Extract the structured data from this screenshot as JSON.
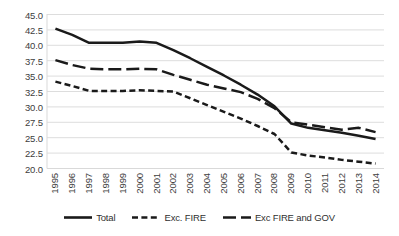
{
  "chart_data": {
    "type": "line",
    "title": "",
    "subtitle": "",
    "xlabel": "",
    "ylabel": "",
    "grid": "horizontal",
    "legend_position": "bottom",
    "ylim": [
      20.0,
      45.0
    ],
    "ytick_step": 2.5,
    "ytick_labels": [
      "45.0",
      "42.5",
      "40.0",
      "37.5",
      "35.0",
      "32.5",
      "30.0",
      "27.5",
      "25.0",
      "22.5",
      "20.0"
    ],
    "categories": [
      "1995",
      "1996",
      "1997",
      "1998",
      "1999",
      "2000",
      "2001",
      "2002",
      "2003",
      "2004",
      "2005",
      "2006",
      "2007",
      "2008",
      "2009",
      "2010",
      "2011",
      "2012",
      "2013",
      "2014"
    ],
    "series": [
      {
        "name": "Total",
        "style": "solid",
        "color": "#1a1a1a",
        "values": [
          42.7,
          41.7,
          40.4,
          40.4,
          40.4,
          40.6,
          40.4,
          39.2,
          37.9,
          36.5,
          35.1,
          33.6,
          32.0,
          30.1,
          27.3,
          26.6,
          26.2,
          25.8,
          25.3,
          24.8
        ]
      },
      {
        "name": "Exc. FIRE",
        "style": "dashed",
        "color": "#1a1a1a",
        "values": [
          34.1,
          33.4,
          32.6,
          32.6,
          32.6,
          32.7,
          32.6,
          32.5,
          31.4,
          30.3,
          29.2,
          28.1,
          26.9,
          25.6,
          22.6,
          22.1,
          21.8,
          21.4,
          21.1,
          20.8
        ]
      },
      {
        "name": "Exc FIRE and GOV",
        "style": "long-dash",
        "color": "#1a1a1a",
        "values": [
          37.6,
          36.8,
          36.2,
          36.1,
          36.1,
          36.2,
          36.1,
          35.2,
          34.4,
          33.6,
          33.0,
          32.4,
          31.3,
          29.8,
          27.5,
          27.1,
          26.7,
          26.3,
          26.6,
          25.9
        ]
      }
    ]
  },
  "legend": {
    "items": [
      {
        "label": "Total",
        "swatch": "solid-line-swatch"
      },
      {
        "label": "Exc. FIRE",
        "swatch": "dashed-line-swatch"
      },
      {
        "label": "Exc FIRE and GOV",
        "swatch": "long-dash-line-swatch"
      }
    ]
  },
  "colors": {
    "line": "#1a1a1a",
    "grid": "#d9d9d9",
    "text": "#3d3d3d",
    "background": "#ffffff"
  }
}
